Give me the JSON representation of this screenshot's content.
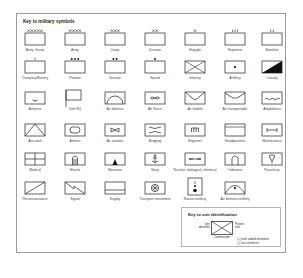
{
  "key": {
    "title": "Key to military symbols",
    "symbols": [
      {
        "label": "Army Group",
        "icon": "army-group-icon"
      },
      {
        "label": "Army",
        "icon": "army-icon"
      },
      {
        "label": "Corps",
        "icon": "corps-icon"
      },
      {
        "label": "Division",
        "icon": "division-icon"
      },
      {
        "label": "Brigade",
        "icon": "brigade-icon"
      },
      {
        "label": "Regiment",
        "icon": "regiment-icon"
      },
      {
        "label": "Battalion",
        "icon": "battalion-icon"
      },
      {
        "label": "Company/Battery",
        "icon": "company-icon"
      },
      {
        "label": "Platoon",
        "icon": "platoon-icon"
      },
      {
        "label": "Section",
        "icon": "section-icon"
      },
      {
        "label": "Squad",
        "icon": "squad-icon"
      },
      {
        "label": "Infantry",
        "icon": "infantry-icon"
      },
      {
        "label": "Artillery",
        "icon": "artillery-icon"
      },
      {
        "label": "Cavalry",
        "icon": "cavalry-icon"
      },
      {
        "label": "Airborne",
        "icon": "airborne-icon"
      },
      {
        "label": "Unit HQ",
        "icon": "unit-hq-icon"
      },
      {
        "label": "Air defence",
        "icon": "air-defence-icon"
      },
      {
        "label": "Air Force",
        "icon": "air-force-icon"
      },
      {
        "label": "Air mobile",
        "icon": "air-mobile-icon"
      },
      {
        "label": "Air transportable",
        "icon": "air-transportable-icon"
      },
      {
        "label": "Amphibious",
        "icon": "amphibious-icon"
      },
      {
        "label": "Anti-tank",
        "icon": "anti-tank-icon"
      },
      {
        "label": "Armour",
        "icon": "armour-icon"
      },
      {
        "label": "Air aviation",
        "icon": "air-aviation-icon"
      },
      {
        "label": "Bridging",
        "icon": "bridging-icon"
      },
      {
        "label": "Engineer",
        "icon": "engineer-icon"
      },
      {
        "label": "Headquarters",
        "icon": "headquarters-icon"
      },
      {
        "label": "Maintenance",
        "icon": "maintenance-icon"
      },
      {
        "label": "Medical",
        "icon": "medical-icon"
      },
      {
        "label": "Missile",
        "icon": "missile-icon"
      },
      {
        "label": "Mountain",
        "icon": "mountain-icon"
      },
      {
        "label": "Navy",
        "icon": "navy-icon"
      },
      {
        "label": "Nuclear, biological, chemical",
        "icon": "nbc-icon"
      },
      {
        "label": "Ordnance",
        "icon": "ordnance-icon"
      },
      {
        "label": "Parachute",
        "icon": "parachute-icon"
      },
      {
        "label": "Reconnaissance",
        "icon": "reconnaissance-icon"
      },
      {
        "label": "Signal",
        "icon": "signal-icon"
      },
      {
        "label": "Supply",
        "icon": "supply-icon"
      },
      {
        "label": "Transport movement",
        "icon": "transport-icon"
      },
      {
        "label": "Rocket artillery",
        "icon": "rocket-artillery-icon"
      },
      {
        "label": "Air defence artillery",
        "icon": "air-defence-artillery-icon"
      }
    ]
  },
  "unit_id": {
    "title": "Key to unit identification",
    "left_label": "Unit identifier",
    "right_label": "Parent unit",
    "bottom_label": "Commander",
    "note_1": "(+) with added elements",
    "note_2": "(-) less elements"
  }
}
